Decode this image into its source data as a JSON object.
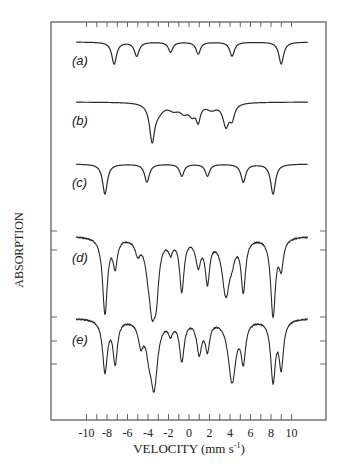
{
  "chart_data": {
    "type": "line",
    "title": "",
    "xlabel": "VELOCITY (mm s⁻¹)",
    "ylabel": "ABSORPTION",
    "xlim": [
      -12,
      13
    ],
    "x_ticks": [
      -10,
      -8,
      -6,
      -4,
      -2,
      0,
      2,
      4,
      6,
      8,
      10
    ],
    "x_minor_step": 1,
    "grid": false,
    "legend": "none",
    "series": [
      {
        "name": "(a)",
        "label": "(a)",
        "baseline_y": 42,
        "noise": 0,
        "peaks": [
          {
            "v": -7.3,
            "depth": 22,
            "width": 0.28
          },
          {
            "v": -5.1,
            "depth": 14,
            "width": 0.28
          },
          {
            "v": -1.8,
            "depth": 10,
            "width": 0.26
          },
          {
            "v": 0.9,
            "depth": 12,
            "width": 0.26
          },
          {
            "v": 4.2,
            "depth": 14,
            "width": 0.28
          },
          {
            "v": 9.0,
            "depth": 22,
            "width": 0.28
          }
        ]
      },
      {
        "name": "(b)",
        "label": "(b)",
        "baseline_y": 102,
        "noise": 0,
        "peaks": [
          {
            "v": -3.6,
            "depth": 36,
            "width": 0.3
          },
          {
            "v": -3.0,
            "depth": 8,
            "width": 0.6
          },
          {
            "v": -1.5,
            "depth": 6,
            "width": 0.6
          },
          {
            "v": -0.5,
            "depth": 8,
            "width": 0.5
          },
          {
            "v": 0.3,
            "depth": 10,
            "width": 0.4
          },
          {
            "v": 0.9,
            "depth": 16,
            "width": 0.25
          },
          {
            "v": 2.2,
            "depth": 6,
            "width": 0.6
          },
          {
            "v": 3.6,
            "depth": 22,
            "width": 0.35
          },
          {
            "v": 4.2,
            "depth": 14,
            "width": 0.3
          }
        ]
      },
      {
        "name": "(c)",
        "label": "(c)",
        "baseline_y": 164,
        "noise": 0,
        "peaks": [
          {
            "v": -8.2,
            "depth": 30,
            "width": 0.28
          },
          {
            "v": -4.1,
            "depth": 18,
            "width": 0.28
          },
          {
            "v": -0.7,
            "depth": 12,
            "width": 0.26
          },
          {
            "v": 1.8,
            "depth": 12,
            "width": 0.26
          },
          {
            "v": 5.3,
            "depth": 18,
            "width": 0.28
          },
          {
            "v": 8.2,
            "depth": 30,
            "width": 0.28
          }
        ]
      },
      {
        "name": "(d)",
        "label": "(d)",
        "baseline_y": 236,
        "noise": 0.7,
        "peaks": [
          {
            "v": -8.2,
            "depth": 76,
            "width": 0.28
          },
          {
            "v": -7.2,
            "depth": 28,
            "width": 0.25
          },
          {
            "v": -5.0,
            "depth": 14,
            "width": 0.3
          },
          {
            "v": -4.0,
            "depth": 18,
            "width": 0.35
          },
          {
            "v": -3.6,
            "depth": 58,
            "width": 0.35
          },
          {
            "v": -3.2,
            "depth": 46,
            "width": 0.3
          },
          {
            "v": -1.8,
            "depth": 12,
            "width": 0.25
          },
          {
            "v": -0.7,
            "depth": 52,
            "width": 0.26
          },
          {
            "v": 0.9,
            "depth": 26,
            "width": 0.3
          },
          {
            "v": 1.8,
            "depth": 42,
            "width": 0.26
          },
          {
            "v": 3.6,
            "depth": 56,
            "width": 0.45
          },
          {
            "v": 4.2,
            "depth": 12,
            "width": 0.3
          },
          {
            "v": 5.3,
            "depth": 52,
            "width": 0.26
          },
          {
            "v": 8.2,
            "depth": 78,
            "width": 0.28
          },
          {
            "v": 9.0,
            "depth": 28,
            "width": 0.25
          }
        ]
      },
      {
        "name": "(e)",
        "label": "(e)",
        "baseline_y": 318,
        "noise": 0.7,
        "peaks": [
          {
            "v": -8.2,
            "depth": 52,
            "width": 0.28
          },
          {
            "v": -7.2,
            "depth": 42,
            "width": 0.26
          },
          {
            "v": -4.7,
            "depth": 22,
            "width": 0.3
          },
          {
            "v": -3.9,
            "depth": 22,
            "width": 0.35
          },
          {
            "v": -3.4,
            "depth": 64,
            "width": 0.4
          },
          {
            "v": -1.8,
            "depth": 12,
            "width": 0.25
          },
          {
            "v": -0.7,
            "depth": 40,
            "width": 0.28
          },
          {
            "v": 1.0,
            "depth": 32,
            "width": 0.3
          },
          {
            "v": 1.8,
            "depth": 28,
            "width": 0.26
          },
          {
            "v": 4.2,
            "depth": 62,
            "width": 0.45
          },
          {
            "v": 5.3,
            "depth": 38,
            "width": 0.26
          },
          {
            "v": 8.2,
            "depth": 60,
            "width": 0.28
          },
          {
            "v": 9.0,
            "depth": 46,
            "width": 0.26
          }
        ]
      }
    ],
    "y_side_ticks": [
      231,
      250,
      317,
      341,
      364
    ]
  },
  "axes": {
    "x_tick_labels": [
      "-10",
      "-8",
      "-6",
      "-4",
      "-2",
      "0",
      "2",
      "4",
      "6",
      "8",
      "10"
    ],
    "xlabel_text": "VELOCITY (mm s",
    "xlabel_sup": "-1",
    "xlabel_close": ")",
    "ylabel_text": "ABSORPTION"
  },
  "colors": {
    "line": "#2a2a2a",
    "frame": "#555555",
    "text": "#222222"
  }
}
